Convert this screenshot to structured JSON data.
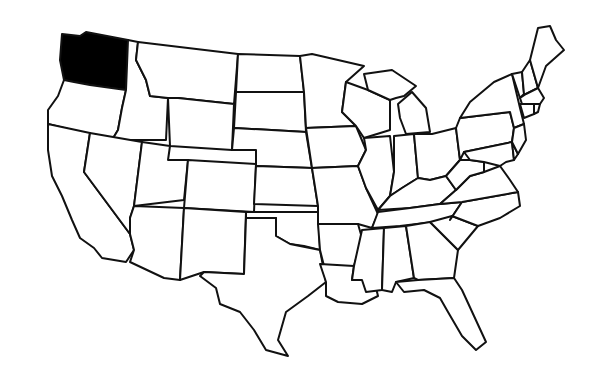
{
  "map": {
    "title": "",
    "region": "United States (contiguous)",
    "highlighted_state": "Washington",
    "highlight_color": "#000000",
    "fill_color": "#ffffff",
    "border_color": "#111111"
  }
}
